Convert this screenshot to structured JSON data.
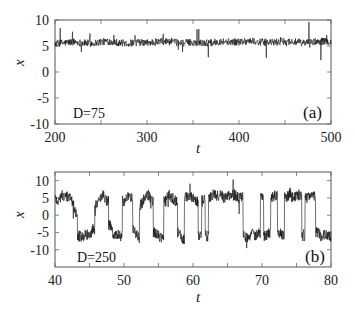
{
  "figure": {
    "panels": [
      "a",
      "b"
    ]
  },
  "chart_data": [
    {
      "type": "line",
      "panel_label": "(a)",
      "annotation": "D=75",
      "title": "",
      "xlabel": "t",
      "ylabel": "x",
      "xlim": [
        200,
        500
      ],
      "ylim": [
        -10,
        10
      ],
      "xticks": [
        200,
        300,
        400,
        500
      ],
      "xtick_labels": [
        "200",
        "300",
        "400",
        "500"
      ],
      "x_minor_ticks": [
        250,
        350,
        450
      ],
      "yticks": [
        -10,
        -5,
        0,
        5,
        10
      ],
      "ytick_labels": [
        "-10",
        "-5",
        "0",
        "5",
        "10"
      ],
      "grid": false,
      "legend": null,
      "description": "Noisy trace confined to the upper well, fluctuating around x≈5.7 (range ~4.5–7).",
      "series": [
        {
          "name": "x(t)",
          "noise_amplitude": 0.7,
          "x": [
            200,
            210,
            220,
            230,
            240,
            250,
            260,
            270,
            280,
            290,
            300,
            310,
            320,
            330,
            340,
            350,
            360,
            370,
            380,
            390,
            400,
            410,
            420,
            430,
            440,
            450,
            460,
            470,
            480,
            490,
            500
          ],
          "values": [
            5.5,
            5.6,
            5.8,
            5.6,
            5.5,
            5.8,
            5.9,
            5.6,
            5.5,
            5.7,
            5.6,
            5.8,
            5.9,
            5.7,
            5.6,
            5.7,
            5.6,
            5.6,
            5.9,
            5.8,
            5.8,
            6.0,
            5.8,
            5.7,
            5.7,
            5.9,
            5.8,
            5.6,
            5.8,
            5.9,
            5.8
          ]
        }
      ]
    },
    {
      "type": "line",
      "panel_label": "(b)",
      "annotation": "D=250",
      "title": "",
      "xlabel": "t",
      "ylabel": "x",
      "xlim": [
        40,
        80
      ],
      "ylim": [
        -15,
        12.5
      ],
      "xticks": [
        40,
        50,
        60,
        70,
        80
      ],
      "xtick_labels": [
        "40",
        "50",
        "60",
        "70",
        "80"
      ],
      "x_minor_ticks": [
        45,
        55,
        65,
        75
      ],
      "yticks": [
        -10,
        -5,
        0,
        5,
        10
      ],
      "ytick_labels": [
        "-10",
        "-5",
        "0",
        "5",
        "10"
      ],
      "grid": false,
      "legend": null,
      "description": "Noisy trace hopping between the two wells at x≈+5.5 and x≈-6 (bistable switching).",
      "series": [
        {
          "name": "x(t)",
          "noise_amplitude": 1.6,
          "x": [
            40,
            40.5,
            41,
            41.5,
            42,
            42.5,
            43,
            43.5,
            44,
            44.5,
            45,
            45.5,
            46,
            46.5,
            47,
            47.5,
            48,
            48.5,
            49,
            49.5,
            50,
            50.5,
            51,
            51.5,
            52,
            52.5,
            53,
            53.5,
            54,
            54.5,
            55,
            55.5,
            56,
            56.5,
            57,
            57.5,
            58,
            58.5,
            59,
            59.5,
            60,
            60.5,
            61,
            61.5,
            62,
            62.5,
            63,
            63.5,
            64,
            64.5,
            65,
            65.5,
            66,
            66.5,
            67,
            67.5,
            68,
            68.5,
            69,
            69.5,
            70,
            70.5,
            71,
            71.5,
            72,
            72.5,
            73,
            73.5,
            74,
            74.5,
            75,
            75.5,
            76,
            76.5,
            77,
            77.5,
            78,
            78.5,
            79,
            79.5,
            80
          ],
          "values": [
            5,
            4,
            6,
            5,
            5.5,
            4,
            1,
            -6,
            -6.5,
            -5.5,
            -6,
            -4,
            3,
            5,
            6,
            4,
            -3,
            -6,
            -5.5,
            -6,
            4,
            5,
            5,
            -4,
            -6.5,
            3,
            5,
            6,
            4,
            -5,
            -6,
            -6.5,
            4,
            6,
            5,
            4,
            -5,
            -7,
            5,
            6,
            5,
            4,
            -6,
            5,
            -6,
            5,
            6,
            5.5,
            6,
            5,
            6,
            5.5,
            6,
            5,
            5.5,
            -6,
            -6.5,
            -5,
            -6,
            -5.5,
            5,
            -6,
            -5,
            5,
            6,
            -5,
            -6,
            5,
            6,
            5,
            5.5,
            6,
            -6,
            5,
            6,
            5.5,
            -5,
            -6,
            -5.5,
            -6,
            -6
          ]
        }
      ]
    }
  ]
}
